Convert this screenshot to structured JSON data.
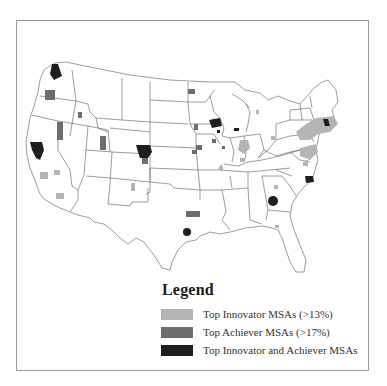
{
  "legend": {
    "title": "Legend",
    "items": [
      {
        "label": "Top Innovator MSAs (>13%)",
        "color": "#b5b5b5",
        "category": "innovator"
      },
      {
        "label": "Top Achiever MSAs (>17%)",
        "color": "#6e6e6e",
        "category": "achiever"
      },
      {
        "label": "Top Innovator and Achiever MSAs",
        "color": "#1e1e1e",
        "category": "both"
      }
    ]
  },
  "map": {
    "region": "Continental United States",
    "state_line_color": "#555555",
    "msa_regions": [
      {
        "name": "Seattle area",
        "category": "both"
      },
      {
        "name": "Portland area",
        "category": "achiever"
      },
      {
        "name": "San Francisco Bay area",
        "category": "both"
      },
      {
        "name": "Sacramento / Central CA",
        "category": "achiever"
      },
      {
        "name": "Los Angeles area",
        "category": "innovator"
      },
      {
        "name": "San Diego area",
        "category": "innovator"
      },
      {
        "name": "Boise area",
        "category": "achiever"
      },
      {
        "name": "Salt Lake City area",
        "category": "achiever"
      },
      {
        "name": "Denver / Boulder area",
        "category": "both"
      },
      {
        "name": "Colorado Springs area",
        "category": "achiever"
      },
      {
        "name": "Albuquerque area",
        "category": "innovator"
      },
      {
        "name": "Dallas area",
        "category": "achiever"
      },
      {
        "name": "Austin area",
        "category": "both"
      },
      {
        "name": "Fargo area",
        "category": "achiever"
      },
      {
        "name": "Sioux Falls area",
        "category": "achiever"
      },
      {
        "name": "Minneapolis area",
        "category": "both"
      },
      {
        "name": "Rochester MN area",
        "category": "both"
      },
      {
        "name": "Madison area",
        "category": "both"
      },
      {
        "name": "Iowa MSAs",
        "category": "achiever"
      },
      {
        "name": "Omaha / Lincoln area",
        "category": "achiever"
      },
      {
        "name": "Chicago area",
        "category": "innovator"
      },
      {
        "name": "Champaign area",
        "category": "innovator"
      },
      {
        "name": "Columbia MO area",
        "category": "innovator"
      },
      {
        "name": "Detroit area",
        "category": "innovator"
      },
      {
        "name": "Northeast corridor",
        "category": "innovator"
      },
      {
        "name": "Boston area",
        "category": "both"
      },
      {
        "name": "Washington DC / Baltimore area",
        "category": "innovator"
      },
      {
        "name": "Raleigh-Durham area",
        "category": "both"
      },
      {
        "name": "Atlanta area",
        "category": "both"
      },
      {
        "name": "Charlottesville area",
        "category": "innovator"
      },
      {
        "name": "Tallahassee area",
        "category": "innovator"
      }
    ]
  }
}
